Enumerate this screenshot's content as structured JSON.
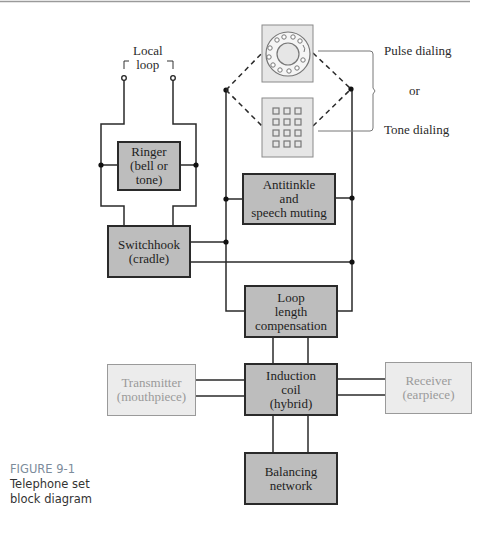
{
  "diagram": {
    "labels": {
      "local_loop": "Local\nloop",
      "pulse_dialing": "Pulse dialing",
      "or": "or",
      "tone_dialing": "Tone dialing"
    },
    "blocks": {
      "ringer": "Ringer\n(bell or\ntone)",
      "switchhook": "Switchhook\n(cradle)",
      "antitinkle": "Antitinkle\nand\nspeech muting",
      "loop_length": "Loop\nlength\ncompensation",
      "induction_coil": "Induction\ncoil\n(hybrid)",
      "transmitter": "Transmitter\n(mouthpiece)",
      "receiver": "Receiver\n(earpiece)",
      "balancing": "Balancing\nnetwork"
    },
    "icons": {
      "rotary_dial": "rotary-dial-icon",
      "keypad": "keypad-icon"
    }
  },
  "caption": {
    "figure": "FIGURE 9-1",
    "line1": "Telephone set",
    "line2": "block diagram"
  }
}
